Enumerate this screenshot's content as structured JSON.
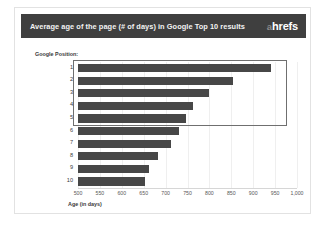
{
  "header": {
    "title": "Average age of the page (# of days) in Google Top 10 results",
    "brand_prefix": "a",
    "brand_name": "hrefs"
  },
  "chart_data": {
    "type": "bar",
    "orientation": "horizontal",
    "title": "Average age of the page (# of days) in Google Top 10 results",
    "xlabel": "Age (in days)",
    "ylabel": "Google Position:",
    "categories": [
      "1",
      "2",
      "3",
      "4",
      "5",
      "6",
      "7",
      "8",
      "9",
      "10"
    ],
    "values": [
      940,
      855,
      800,
      763,
      747,
      731,
      712,
      683,
      662,
      653
    ],
    "xlim": [
      500,
      1000
    ],
    "xticks": [
      500,
      550,
      600,
      650,
      700,
      750,
      800,
      850,
      900,
      950,
      1000
    ],
    "xtick_labels": [
      "500",
      "550",
      "600",
      "650",
      "700",
      "750",
      "800",
      "850",
      "900",
      "950",
      "1,000"
    ],
    "grid": true,
    "legend": false,
    "bar_color": "#474747",
    "annotations": [
      {
        "name": "highlight-box",
        "note": "rectangle outlining positions 1 through 5"
      }
    ]
  },
  "colors": {
    "header_bg": "#3f3f3f",
    "header_text": "#f2f2f2",
    "bar": "#474747",
    "slide_bg": "#ffffff",
    "slide_border": "#e2e2e2",
    "highlight_border": "#6f6f6f"
  }
}
